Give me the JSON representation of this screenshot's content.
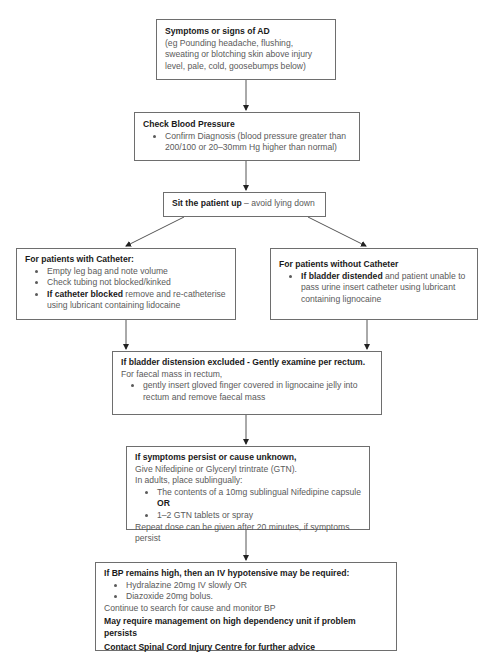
{
  "diagram": {
    "box1": {
      "title": "Symptoms or signs of AD",
      "text": "(eg Pounding headache, flushing, sweating or blotching skin above injury level, pale, cold, goosebumps below)"
    },
    "box2": {
      "title": "Check Blood Pressure",
      "bullets": [
        "Confirm Diagnosis (blood pressure greater than 200/100 or 20–30mm Hg higher than normal)"
      ]
    },
    "box3": {
      "title": "Sit the patient up",
      "text": " – avoid lying down"
    },
    "box4": {
      "title": "For patients with Catheter:",
      "bullets": [
        {
          "bold": "",
          "text": "Empty leg bag and note volume"
        },
        {
          "bold": "",
          "text": "Check tubing not blocked/kinked"
        },
        {
          "bold": "If catheter blocked",
          "text": " remove and re-catheterise using lubricant containing lidocaine"
        }
      ]
    },
    "box5": {
      "title": "For patients without Catheter",
      "bullets": [
        {
          "bold": "If bladder distended",
          "text": " and patient unable to pass urine insert catheter using lubricant containing lignocaine"
        }
      ]
    },
    "box6": {
      "title": "If bladder distension excluded - Gently examine per rectum.",
      "text": "For faecal mass in rectum,",
      "bullets": [
        "gently insert gloved finger covered in lignocaine jelly into rectum and remove faecal mass"
      ]
    },
    "box7": {
      "title": "If symptoms persist or cause unknown,",
      "line1": "Give Nifedipine or Glyceryl trintrate (GTN).",
      "line2": "In adults, place sublingually:",
      "bullets": [
        {
          "text": "The contents of a 10mg sublingual Nifedipine capsule ",
          "bold": "OR"
        },
        {
          "text": "1–2 GTN tablets or spray",
          "bold": ""
        }
      ],
      "line3": "Repeat dose can be given after 20 minutes, if symptoms persist"
    },
    "box8": {
      "title": "If BP remains high, then an IV hypotensive may be required:",
      "bullets": [
        "Hydralazine 20mg IV slowly OR",
        "Diazoxide 20mg bolus."
      ],
      "line1": "Continue to search for cause and monitor BP",
      "bold1": "May require management on high dependency unit if problem persists",
      "bold2": "Contact Spinal Cord Injury Centre for further advice"
    }
  }
}
